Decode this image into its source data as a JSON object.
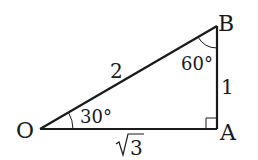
{
  "figure": {
    "type": "right-triangle",
    "vertices": {
      "O": {
        "label": "O"
      },
      "A": {
        "label": "A"
      },
      "B": {
        "label": "B"
      }
    },
    "sides": {
      "OB": {
        "label": "2"
      },
      "AB": {
        "label": "1"
      },
      "OA": {
        "label": "3",
        "radical": "√"
      }
    },
    "angles": {
      "O": {
        "label": "30°"
      },
      "B": {
        "label": "60°"
      },
      "A": {
        "label": "right-angle"
      }
    },
    "colors": {
      "line": "#1a1a1a",
      "background": "#ffffff"
    }
  }
}
